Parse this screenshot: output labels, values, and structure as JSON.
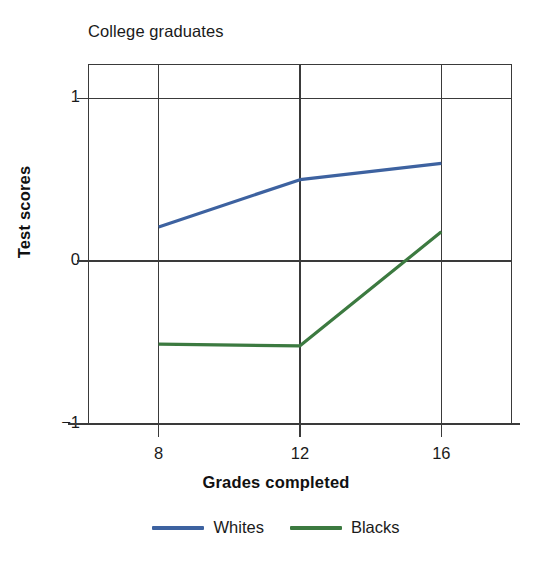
{
  "chart_data": {
    "type": "line",
    "title": "College graduates",
    "xlabel": "Grades completed",
    "ylabel": "Test scores",
    "x": [
      8,
      12,
      16
    ],
    "xtick_labels": [
      "8",
      "12",
      "16"
    ],
    "ytick_labels": [
      "1",
      "0",
      "−1"
    ],
    "yticks": [
      1,
      0,
      -1
    ],
    "xlim": [
      6,
      18
    ],
    "ylim": [
      -1,
      1.21
    ],
    "grid": true,
    "legend_position": "below",
    "series": [
      {
        "name": "Whites",
        "color": "#3d62a0",
        "values": [
          0.21,
          0.5,
          0.6
        ]
      },
      {
        "name": "Blacks",
        "color": "#3c7a40",
        "values": [
          -0.51,
          -0.52,
          0.18
        ]
      }
    ]
  },
  "axis_color": "#3a3a3a",
  "background": "#ffffff"
}
